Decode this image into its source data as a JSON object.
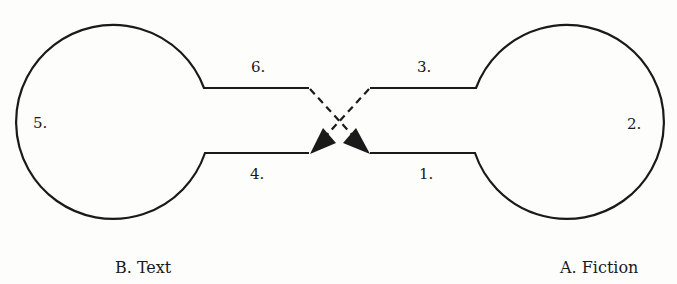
{
  "diagram": {
    "left_node": {
      "caption": "B. Text",
      "side_label": "5.",
      "upper_label": "6.",
      "lower_label": "4."
    },
    "right_node": {
      "caption": "A. Fiction",
      "side_label": "2.",
      "upper_label": "3.",
      "lower_label": "1."
    },
    "connector": "crossing dashed arrows",
    "stroke_color": "#1a1a1a",
    "background_color": "#fdfdfb"
  }
}
